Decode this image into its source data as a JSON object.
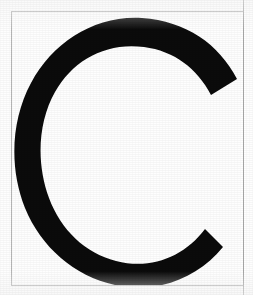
{
  "document": {
    "kind": "scanned-letter-specimen",
    "letter": "C",
    "caption": "",
    "ink_color": "#0b0b0b",
    "paper_color": "#fefefe",
    "rule_color": "#b6b6b6"
  },
  "frame": {
    "top_rule_label": "",
    "bottom_rule_label": "",
    "left_rule_label": "",
    "right_rule_label": ""
  },
  "glyph": {
    "character": "C",
    "name": "latin-capital-letter-c",
    "style": "heavy-sans-serif",
    "fill": "#0b0b0b",
    "bounds": {
      "left": 33,
      "top": 30,
      "right": 226,
      "bottom": 268
    },
    "stroke_width": 22,
    "terminal_upper": {
      "x": 222,
      "y": 100
    },
    "terminal_lower": {
      "x": 222,
      "y": 195
    },
    "path": "M 200 84 C 186 57 163 40 133 36 C 95 31 62 49 44 81 C 27 111 25 152 38 187 C 50 219 74 242 105 250 C 140 259 173 246 194 218 L 212 236 C 186 268 145 283 104 274 C 63 265 30 236 14 197 C -2 157 0 109 20 72 C 42 31 84 4 131 7 C 175 10 208 33 226 68 Z"
  }
}
